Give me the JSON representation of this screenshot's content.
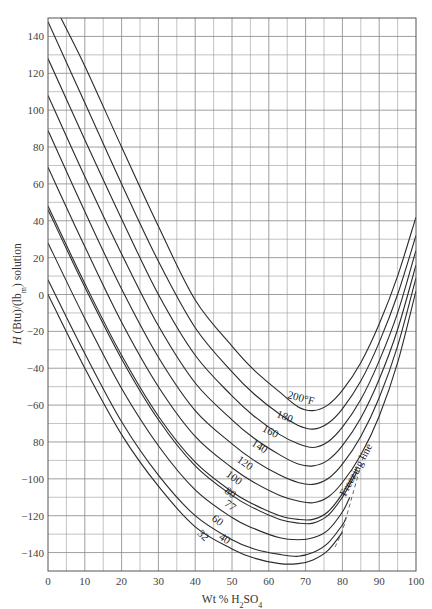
{
  "chart_data": {
    "type": "line",
    "title": "",
    "xlabel": "Wt % H2SO4",
    "xlabel_parts": {
      "prefix": "Wt %  H",
      "sub1": "2",
      "mid": "SO",
      "sub2": "4"
    },
    "ylabel": "H (Btu)/(lbm) solution",
    "ylabel_parts": {
      "italic": "H",
      "rest1": " (Btu)/(lb",
      "sub": "m",
      "rest2": ") solution"
    },
    "xlim": [
      0,
      100
    ],
    "ylim": [
      -150,
      150
    ],
    "grid": true,
    "x_ticks": [
      0,
      10,
      20,
      30,
      40,
      50,
      60,
      70,
      80,
      90,
      100
    ],
    "y_ticks": [
      140,
      120,
      100,
      80,
      60,
      40,
      20,
      0,
      -20,
      -40,
      -60,
      -80,
      -100,
      -120,
      -140
    ],
    "y_tick_labels": [
      "140",
      "120",
      "100",
      "80",
      "60",
      "40",
      "20",
      "0",
      "−20",
      "−40",
      "−60",
      "80",
      "−100",
      "−120",
      "−140"
    ],
    "annotation": "Freezing line",
    "series": [
      {
        "name": "200°F",
        "label": "200°F",
        "points": [
          [
            3.5,
            150
          ],
          [
            10,
            124
          ],
          [
            20,
            80
          ],
          [
            30,
            37
          ],
          [
            40,
            -3
          ],
          [
            50,
            -28
          ],
          [
            56,
            -41
          ],
          [
            63,
            -53
          ],
          [
            68,
            -61
          ],
          [
            72,
            -63
          ],
          [
            76,
            -60
          ],
          [
            80,
            -52
          ],
          [
            85,
            -37
          ],
          [
            90,
            -16
          ],
          [
            95,
            10
          ],
          [
            100,
            42
          ]
        ]
      },
      {
        "name": "180°F",
        "label": "180",
        "points": [
          [
            0,
            148
          ],
          [
            10,
            104
          ],
          [
            20,
            60
          ],
          [
            30,
            18
          ],
          [
            40,
            -18
          ],
          [
            50,
            -42
          ],
          [
            56,
            -54
          ],
          [
            63,
            -65
          ],
          [
            68,
            -71
          ],
          [
            72,
            -73
          ],
          [
            76,
            -70
          ],
          [
            80,
            -62
          ],
          [
            85,
            -47
          ],
          [
            90,
            -26
          ],
          [
            95,
            0
          ],
          [
            100,
            32
          ]
        ]
      },
      {
        "name": "160°F",
        "label": "160",
        "points": [
          [
            0,
            128
          ],
          [
            10,
            84
          ],
          [
            20,
            41
          ],
          [
            30,
            0
          ],
          [
            40,
            -33
          ],
          [
            50,
            -55
          ],
          [
            56,
            -66
          ],
          [
            63,
            -76
          ],
          [
            68,
            -81
          ],
          [
            72,
            -83
          ],
          [
            76,
            -80
          ],
          [
            80,
            -72
          ],
          [
            85,
            -57
          ],
          [
            90,
            -36
          ],
          [
            95,
            -10
          ],
          [
            100,
            24
          ]
        ]
      },
      {
        "name": "140°F",
        "label": "140",
        "points": [
          [
            0,
            108
          ],
          [
            10,
            64
          ],
          [
            20,
            22
          ],
          [
            30,
            -17
          ],
          [
            40,
            -48
          ],
          [
            50,
            -68
          ],
          [
            56,
            -78
          ],
          [
            63,
            -87
          ],
          [
            68,
            -92
          ],
          [
            72,
            -93
          ],
          [
            76,
            -90
          ],
          [
            80,
            -82
          ],
          [
            85,
            -67
          ],
          [
            90,
            -46
          ],
          [
            95,
            -19
          ],
          [
            100,
            16
          ]
        ]
      },
      {
        "name": "120°F",
        "label": "120",
        "points": [
          [
            0,
            89
          ],
          [
            10,
            45
          ],
          [
            20,
            3
          ],
          [
            30,
            -34
          ],
          [
            40,
            -63
          ],
          [
            50,
            -81
          ],
          [
            56,
            -90
          ],
          [
            63,
            -98
          ],
          [
            68,
            -102
          ],
          [
            72,
            -103
          ],
          [
            76,
            -100
          ],
          [
            80,
            -92
          ],
          [
            85,
            -77
          ],
          [
            90,
            -56
          ],
          [
            95,
            -28
          ],
          [
            100,
            9
          ]
        ]
      },
      {
        "name": "100°F",
        "label": "100",
        "points": [
          [
            0,
            69
          ],
          [
            10,
            26
          ],
          [
            20,
            -15
          ],
          [
            30,
            -50
          ],
          [
            40,
            -77
          ],
          [
            50,
            -94
          ],
          [
            56,
            -102
          ],
          [
            63,
            -109
          ],
          [
            68,
            -112
          ],
          [
            72,
            -113
          ],
          [
            76,
            -110
          ],
          [
            80,
            -102
          ],
          [
            85,
            -87
          ],
          [
            90,
            -66
          ],
          [
            95,
            -37
          ],
          [
            100,
            2
          ]
        ]
      },
      {
        "name": "80°F",
        "label": "80",
        "points": [
          [
            0,
            48
          ],
          [
            10,
            6
          ],
          [
            20,
            -33
          ],
          [
            30,
            -66
          ],
          [
            40,
            -91
          ],
          [
            50,
            -107
          ],
          [
            56,
            -114
          ],
          [
            63,
            -120
          ],
          [
            68,
            -122
          ],
          [
            72,
            -122
          ],
          [
            76,
            -118
          ],
          [
            80,
            -108
          ],
          [
            84,
            -94
          ]
        ]
      },
      {
        "name": "77°F",
        "label": "77",
        "points": [
          [
            0,
            46
          ],
          [
            10,
            4
          ],
          [
            20,
            -35
          ],
          [
            30,
            -68
          ],
          [
            40,
            -93
          ],
          [
            50,
            -109
          ],
          [
            56,
            -116
          ],
          [
            63,
            -122
          ],
          [
            68,
            -124
          ],
          [
            72,
            -124
          ],
          [
            76,
            -120
          ],
          [
            80,
            -110
          ],
          [
            84,
            -96
          ]
        ]
      },
      {
        "name": "60°F",
        "label": "60",
        "points": [
          [
            0,
            28
          ],
          [
            10,
            -13
          ],
          [
            20,
            -51
          ],
          [
            30,
            -82
          ],
          [
            40,
            -106
          ],
          [
            50,
            -121
          ],
          [
            56,
            -127
          ],
          [
            63,
            -132
          ],
          [
            68,
            -133
          ],
          [
            72,
            -132
          ],
          [
            76,
            -128
          ],
          [
            80,
            -118
          ],
          [
            82,
            -110
          ]
        ]
      },
      {
        "name": "40°F",
        "label": "40",
        "points": [
          [
            0,
            8
          ],
          [
            10,
            -32
          ],
          [
            20,
            -69
          ],
          [
            30,
            -98
          ],
          [
            40,
            -120
          ],
          [
            50,
            -133
          ],
          [
            56,
            -138
          ],
          [
            63,
            -141
          ],
          [
            68,
            -142
          ],
          [
            72,
            -140
          ],
          [
            76,
            -135
          ],
          [
            80,
            -125
          ],
          [
            81,
            -121
          ]
        ]
      },
      {
        "name": "32°F",
        "label": "32",
        "points": [
          [
            0,
            0
          ],
          [
            10,
            -40
          ],
          [
            20,
            -76
          ],
          [
            30,
            -104
          ],
          [
            40,
            -126
          ],
          [
            50,
            -138
          ],
          [
            56,
            -143
          ],
          [
            63,
            -146
          ],
          [
            68,
            -146
          ],
          [
            72,
            -144
          ],
          [
            76,
            -139
          ],
          [
            80,
            -129
          ]
        ]
      }
    ],
    "label_positions": [
      {
        "text": "200°F",
        "x": 68.5,
        "y": -58,
        "rot": 15
      },
      {
        "text": "180",
        "x": 64,
        "y": -68,
        "rot": 22
      },
      {
        "text": "160",
        "x": 60,
        "y": -76,
        "rot": 27
      },
      {
        "text": "140",
        "x": 57,
        "y": -84,
        "rot": 32
      },
      {
        "text": "120",
        "x": 53,
        "y": -93,
        "rot": 35
      },
      {
        "text": "100",
        "x": 50,
        "y": -101,
        "rot": 36
      },
      {
        "text": "80",
        "x": 49,
        "y": -109,
        "rot": 36
      },
      {
        "text": "77",
        "x": 49,
        "y": -116,
        "rot": 36
      },
      {
        "text": "60",
        "x": 45.5,
        "y": -124,
        "rot": 38
      },
      {
        "text": "40",
        "x": 47.5,
        "y": -134,
        "rot": 34
      },
      {
        "text": "32",
        "x": 41.5,
        "y": -132,
        "rot": 44
      }
    ],
    "freezing_line": [
      [
        78,
        -137
      ],
      [
        80,
        -128
      ],
      [
        82,
        -114
      ],
      [
        84,
        -100
      ],
      [
        86,
        -86
      ]
    ],
    "freezing_label": {
      "x": 84.5,
      "y": -96,
      "rot": -62
    }
  }
}
